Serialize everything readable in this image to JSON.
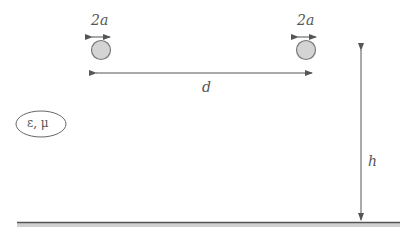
{
  "diagram": {
    "labels": {
      "left_diameter": "2a",
      "right_diameter": "2a",
      "separation": "d",
      "height": "h",
      "medium": "ε, μ"
    },
    "colors": {
      "circle_fill": "#d4d4d4",
      "circle_stroke": "#777777",
      "line": "#555555",
      "ground": "#555555",
      "ground_shadow": "#cfcfcf",
      "text": "#555555"
    }
  }
}
